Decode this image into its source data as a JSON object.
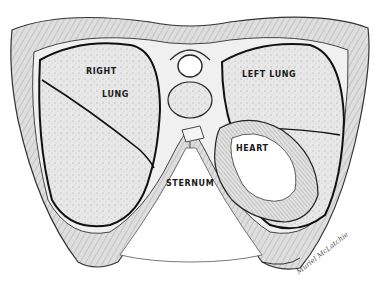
{
  "diagram": {
    "type": "anatomical-cross-section",
    "labels": {
      "right_lung_line1": "RIGHT",
      "right_lung_line2": "LUNG",
      "left_lung": "LEFT LUNG",
      "heart": "HEART",
      "sternum": "STERNUM"
    },
    "signature": "Muriel McLatchie",
    "colors": {
      "background": "#ffffff",
      "ink": "#1a1a1a",
      "tissue_fill": "#d9d9d9",
      "lung_fill": "#e6e6e6",
      "bone_fill": "#f4f4f4"
    }
  }
}
